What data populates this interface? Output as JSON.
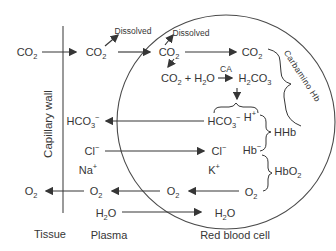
{
  "colors": {
    "background": "#ffffff",
    "ink": "#363636",
    "capillary_wall": "#9a9a9a",
    "cell_membrane": "#4a4a4a"
  },
  "zones": {
    "tissue": "Tissue",
    "plasma": "Plasma",
    "red_blood_cell": "Red blood cell",
    "capillary_wall": "Capillary wall"
  },
  "tissue": {
    "co2": "CO<sub>2</sub>",
    "o2": "O<sub>2</sub>"
  },
  "plasma": {
    "co2": "CO<sub>2</sub>",
    "dissolved": "Dissolved",
    "hco3": "HCO<sub>3</sub><sup>−</sup>",
    "cl": "Cl<sup>−</sup>",
    "na": "Na<sup>+</sup>",
    "o2": "O<sub>2</sub>",
    "h2o": "H<sub>2</sub>O"
  },
  "rbc": {
    "co2_entry": "CO<sub>2</sub>",
    "dissolved": "Dissolved",
    "co2_carbamino": "CO<sub>2</sub>",
    "hydration_reactants": "CO<sub>2</sub> + H<sub>2</sub>O",
    "enzyme": "CA",
    "carbonic_acid": "H<sub>2</sub>CO<sub>3</sub>",
    "hco3": "HCO<sub>3</sub><sup>−</sup>",
    "h_ion": "H<sup>+</sup>",
    "hhb": "HHb",
    "cl": "Cl<sup>−</sup>",
    "hb": "Hb<sup>−</sup>",
    "k": "K<sup>+</sup>",
    "hbo2": "HbO<sub>2</sub>",
    "o2_released": "O<sub>2</sub>",
    "o2_bound": "O<sub>2</sub>",
    "h2o": "H<sub>2</sub>O",
    "carbamino_label": "Carbamino Hb"
  }
}
